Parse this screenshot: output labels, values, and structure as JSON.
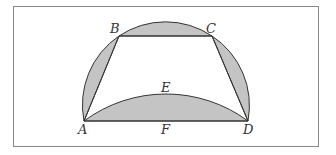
{
  "figure": {
    "frame": {
      "x": 13,
      "y": 6,
      "width": 305,
      "height": 140,
      "stroke": "#888888"
    },
    "colors": {
      "fill": "#c4c4c4",
      "stroke": "#333333"
    },
    "points": {
      "A": {
        "label": "A",
        "x": 84,
        "y": 121
      },
      "B": {
        "label": "B",
        "x": 119,
        "y": 36
      },
      "C": {
        "label": "C",
        "x": 212,
        "y": 36
      },
      "D": {
        "label": "D",
        "x": 248,
        "y": 121
      },
      "E": {
        "label": "E",
        "x": 166,
        "y": 94
      },
      "F": {
        "label": "F",
        "x": 166,
        "y": 121
      }
    },
    "outer_arc": {
      "cx": 166,
      "cy": 106.3,
      "r": 83.3
    },
    "inner_arc": {
      "cx": 166,
      "cy": 232,
      "r": 138
    }
  }
}
